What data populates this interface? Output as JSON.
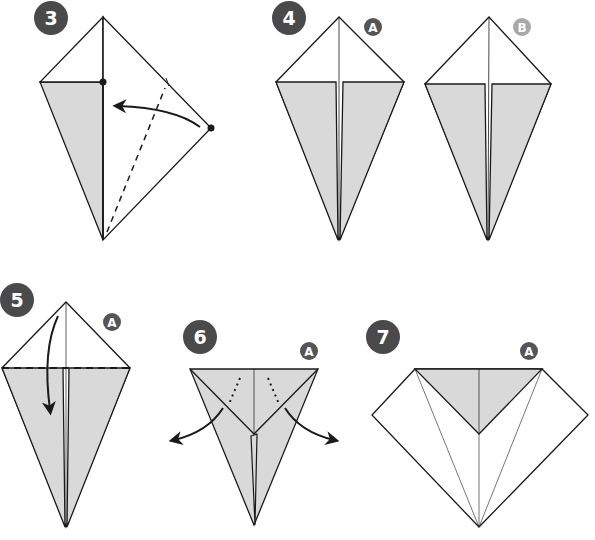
{
  "diagram": {
    "type": "origami-instructions",
    "colors": {
      "paper_front": "#ffffff",
      "paper_back": "#d9d9d9",
      "line": "#1a1a1a",
      "step_badge": "#4a4a4a",
      "view_badge_a": "#555555",
      "view_badge_b": "#a8a8a8"
    },
    "steps": [
      {
        "number": "3",
        "view": "",
        "action": "fold right corner to center line along dashed valley fold"
      },
      {
        "number": "4",
        "view": "A",
        "action": "result view A"
      },
      {
        "number": "4",
        "view": "B",
        "action": "result view B"
      },
      {
        "number": "5",
        "view": "A",
        "action": "valley fold top triangle down along dashed line"
      },
      {
        "number": "6",
        "view": "A",
        "action": "pull out inner flaps to the sides"
      },
      {
        "number": "7",
        "view": "A",
        "action": "result"
      }
    ],
    "labels": {
      "step3": "3",
      "step4": "4",
      "step5": "5",
      "step6": "6",
      "step7": "7",
      "viewA": "A",
      "viewB": "B"
    }
  }
}
